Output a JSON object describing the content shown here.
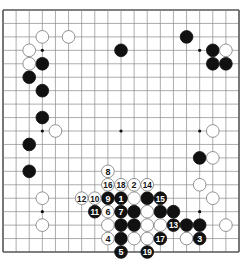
{
  "diagram": {
    "type": "go-board",
    "size": 19,
    "colors": {
      "background": "#ffffff",
      "grid": "#8a8a8a",
      "border": "#555555",
      "black": "#111111",
      "white": "#ffffff",
      "stone_outline": "#777777"
    },
    "star_points": [
      [
        3,
        3
      ],
      [
        9,
        3
      ],
      [
        15,
        3
      ],
      [
        3,
        9
      ],
      [
        9,
        9
      ],
      [
        15,
        9
      ],
      [
        3,
        15
      ],
      [
        9,
        15
      ],
      [
        15,
        15
      ]
    ],
    "black_stones": [
      [
        3,
        4
      ],
      [
        2,
        5
      ],
      [
        3,
        6
      ],
      [
        3,
        8
      ],
      [
        2,
        10
      ],
      [
        2,
        12
      ],
      [
        9,
        3
      ],
      [
        14,
        2
      ],
      [
        16,
        3
      ],
      [
        16,
        4
      ],
      [
        17,
        4
      ],
      [
        15,
        11
      ],
      [
        11,
        14
      ],
      [
        10,
        15
      ],
      [
        12,
        15
      ],
      [
        13,
        15
      ],
      [
        9,
        16
      ],
      [
        10,
        16
      ],
      [
        14,
        16
      ],
      [
        15,
        16
      ],
      [
        9,
        17
      ]
    ],
    "white_stones": [
      [
        3,
        2
      ],
      [
        5,
        2
      ],
      [
        2,
        3
      ],
      [
        2,
        4
      ],
      [
        4,
        9
      ],
      [
        17,
        3
      ],
      [
        16,
        9
      ],
      [
        16,
        11
      ],
      [
        15,
        13
      ],
      [
        16,
        14
      ],
      [
        17,
        16
      ],
      [
        3,
        14
      ],
      [
        3,
        16
      ],
      [
        10,
        14
      ],
      [
        11,
        15
      ],
      [
        8,
        16
      ],
      [
        11,
        16
      ],
      [
        12,
        16
      ],
      [
        10,
        17
      ],
      [
        11,
        17
      ],
      [
        14,
        17
      ]
    ],
    "numbered_moves": [
      {
        "n": "1",
        "color": "black",
        "col": 9,
        "row": 14
      },
      {
        "n": "2",
        "color": "white",
        "col": 10,
        "row": 13
      },
      {
        "n": "3",
        "color": "black",
        "col": 15,
        "row": 17
      },
      {
        "n": "4",
        "color": "white",
        "col": 8,
        "row": 17
      },
      {
        "n": "5",
        "color": "black",
        "col": 9,
        "row": 18
      },
      {
        "n": "6",
        "color": "white",
        "col": 8,
        "row": 15
      },
      {
        "n": "7",
        "color": "black",
        "col": 9,
        "row": 15
      },
      {
        "n": "8",
        "color": "white",
        "col": 8,
        "row": 12
      },
      {
        "n": "9",
        "color": "black",
        "col": 8,
        "row": 14
      },
      {
        "n": "10",
        "color": "white",
        "col": 7,
        "row": 14
      },
      {
        "n": "11",
        "color": "black",
        "col": 7,
        "row": 15
      },
      {
        "n": "12",
        "color": "white",
        "col": 6,
        "row": 14
      },
      {
        "n": "13",
        "color": "black",
        "col": 13,
        "row": 16
      },
      {
        "n": "14",
        "color": "white",
        "col": 11,
        "row": 13
      },
      {
        "n": "15",
        "color": "black",
        "col": 12,
        "row": 14
      },
      {
        "n": "16",
        "color": "white",
        "col": 8,
        "row": 13
      },
      {
        "n": "17",
        "color": "black",
        "col": 12,
        "row": 17
      },
      {
        "n": "18",
        "color": "white",
        "col": 9,
        "row": 13
      },
      {
        "n": "19",
        "color": "black",
        "col": 11,
        "row": 18
      }
    ]
  }
}
